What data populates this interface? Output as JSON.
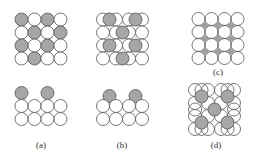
{
  "figure": {
    "panels": [
      {
        "id": "a",
        "label": "(a)",
        "description": "Top view: square lattice with adatoms on top sites (checkerboard); side view: adatoms directly above substrate atoms"
      },
      {
        "id": "b",
        "label": "(b)",
        "description": "Top view: adatoms in bridge/hollow sites between substrate atoms; side view: adatoms in hollows between atoms"
      },
      {
        "id": "c",
        "label": "(c)",
        "description": "Top view: square lattice with small gray interstitial sites"
      },
      {
        "id": "d",
        "label": "(d)",
        "description": "Top view: adatoms in fourfold hollow sites (centered pattern)"
      }
    ],
    "colors": {
      "substrate_fill": "#ffffff",
      "adatom_fill": "#a6a6a6",
      "stroke": "#555555",
      "interstice_fill": "#a0a0a0"
    }
  }
}
